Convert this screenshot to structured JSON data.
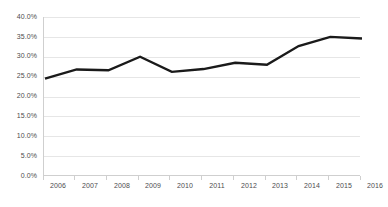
{
  "chart_data": {
    "type": "line",
    "title": "",
    "subtitle": "",
    "xlabel": "",
    "ylabel": "",
    "categories": [
      "2006",
      "2007",
      "2008",
      "2009",
      "2010",
      "2011",
      "2012",
      "2013",
      "2014",
      "2015",
      "2016"
    ],
    "x": [
      2006,
      2007,
      2008,
      2009,
      2010,
      2011,
      2012,
      2013,
      2014,
      2015,
      2016
    ],
    "values": [
      24.5,
      26.8,
      26.6,
      30.0,
      26.2,
      26.9,
      28.5,
      28.0,
      32.7,
      35.0,
      34.6
    ],
    "series": [
      {
        "name": "",
        "values": [
          24.5,
          26.8,
          26.6,
          30.0,
          26.2,
          26.9,
          28.5,
          28.0,
          32.7,
          35.0,
          34.6
        ]
      }
    ],
    "ylim": [
      0,
      40
    ],
    "yticks": [
      0,
      5,
      10,
      15,
      20,
      25,
      30,
      35,
      40
    ],
    "ytick_labels": [
      "0.0%",
      "5.0%",
      "10.0%",
      "15.0%",
      "20.0%",
      "25.0%",
      "30.0%",
      "35.0%",
      "40.0%"
    ],
    "xtick_labels": [
      "2006",
      "2007",
      "2008",
      "2009",
      "2010",
      "2011",
      "2012",
      "2013",
      "2014",
      "2015",
      "2016"
    ],
    "grid": true,
    "grid_axis": "y",
    "legend": false,
    "legend_position": "none",
    "annotations": [],
    "colors": {
      "line": "#1a1a1a",
      "gridline": "#e6e6e6",
      "axis": "#cfcfcf",
      "tick_text": "#4d4d4d",
      "background": "#ffffff"
    },
    "line_width": 2.4
  }
}
